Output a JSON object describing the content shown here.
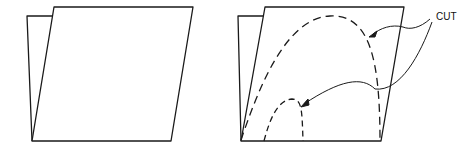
{
  "figures": [
    {
      "id": "unmarked-folded-sheet",
      "description": "Folded sheet without cut lines"
    },
    {
      "id": "marked-folded-sheet",
      "description": "Folded sheet with dashed cut lines"
    }
  ],
  "annotations": {
    "cut_label": "CUT"
  },
  "colors": {
    "stroke": "#1a1a1a",
    "background": "#ffffff"
  }
}
